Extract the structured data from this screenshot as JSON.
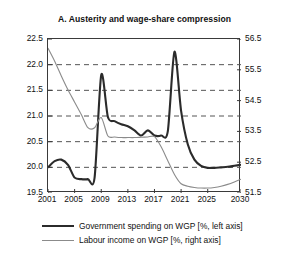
{
  "chart_data": {
    "type": "line",
    "title": "A. Austerity and wage-share compression",
    "xlabel": "",
    "ylabel": "",
    "grid": true,
    "legend_position": "bottom",
    "x": [
      2001,
      2002,
      2003,
      2004,
      2005,
      2006,
      2007,
      2008,
      2009,
      2010,
      2011,
      2012,
      2013,
      2014,
      2015,
      2016,
      2017,
      2018,
      2019,
      2020,
      2021,
      2022,
      2023,
      2024,
      2025,
      2026,
      2027,
      2028,
      2029,
      2030
    ],
    "xlim": [
      2001,
      2030
    ],
    "xticks": [
      2001,
      2005,
      2009,
      2013,
      2017,
      2021,
      2025,
      2030
    ],
    "xticklabels": [
      "2001",
      "2005",
      "2009",
      "2013",
      "2017",
      "2021",
      "2025",
      "2030"
    ],
    "axes": [
      {
        "id": "left",
        "label": "Government spending on WGP [%, left axis]",
        "ylim": [
          19.5,
          22.5
        ],
        "yticks": [
          19.5,
          20.0,
          20.5,
          21.0,
          21.5,
          22.0,
          22.5
        ],
        "yticklabels": [
          "19.5",
          "20.0",
          "20.5",
          "21.0",
          "21.5",
          "22.0",
          "22.5"
        ]
      },
      {
        "id": "right",
        "label": "Labour income on WGP [%, right axis]",
        "ylim": [
          51.5,
          56.5
        ],
        "yticks": [
          51.5,
          52.5,
          53.5,
          54.5,
          55.5,
          56.5
        ],
        "yticklabels": [
          "51.5",
          "52.5",
          "53.5",
          "54.5",
          "55.5",
          "56.5"
        ]
      }
    ],
    "series": [
      {
        "name": "Government spending on WGP [%, left axis]",
        "axis": "left",
        "color": "#2b2b2b",
        "width": 2.1,
        "values": [
          20.0,
          20.12,
          20.15,
          20.05,
          19.8,
          19.77,
          19.77,
          19.8,
          21.8,
          20.98,
          20.9,
          20.84,
          20.8,
          20.72,
          20.62,
          20.72,
          20.62,
          20.62,
          20.7,
          22.25,
          21.1,
          20.45,
          20.15,
          20.03,
          19.99,
          19.99,
          20.0,
          20.01,
          20.03,
          20.05
        ]
      },
      {
        "name": "Labour income on WGP [%, right axis]",
        "axis": "right",
        "color": "#8b8b8b",
        "width": 1.1,
        "values": [
          56.2,
          55.78,
          55.3,
          54.85,
          54.45,
          54.05,
          53.62,
          53.62,
          53.95,
          53.35,
          53.32,
          53.3,
          53.3,
          53.3,
          53.31,
          53.32,
          53.33,
          53.0,
          52.55,
          52.1,
          51.8,
          51.72,
          51.68,
          51.66,
          51.66,
          51.68,
          51.72,
          51.78,
          51.86,
          51.95
        ]
      }
    ]
  },
  "legend": {
    "items": [
      {
        "label": "Government spending on WGP [%, left axis]",
        "swatch": "gov"
      },
      {
        "label": "Labour income on WGP [%, right axis]",
        "swatch": "lab"
      }
    ]
  }
}
